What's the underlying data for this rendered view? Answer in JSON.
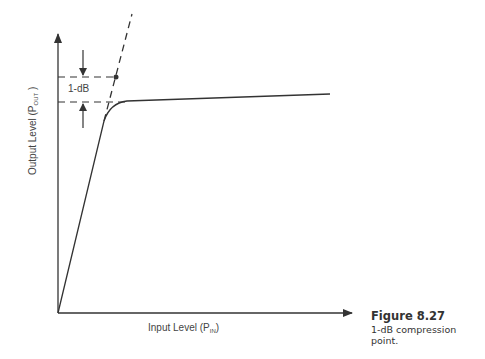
{
  "diagram": {
    "y_axis": {
      "label_main": "Output Level (P",
      "label_sub": "OUT",
      "label_end": " )"
    },
    "x_axis": {
      "label_main": "Input Level (P",
      "label_sub": "IN",
      "label_end": ")"
    },
    "annotation": "1-dB",
    "caption": {
      "figure": "Figure 8.27",
      "description": "1-dB compression point."
    },
    "colors": {
      "line": "#333333",
      "background": "#ffffff"
    }
  }
}
